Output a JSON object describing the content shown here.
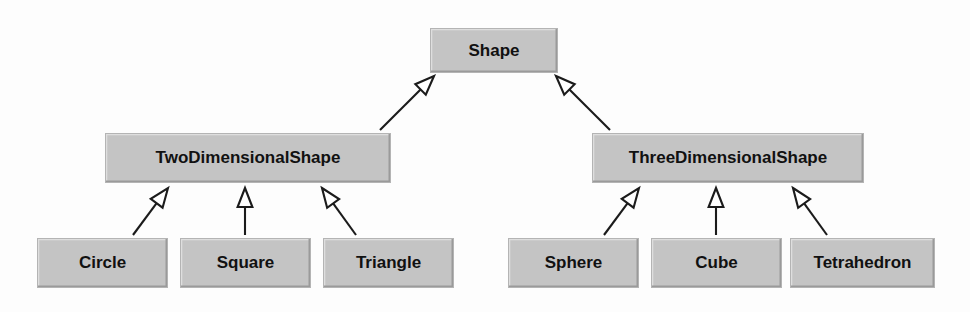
{
  "diagram": {
    "kind": "uml-class-hierarchy",
    "canvas": {
      "width": 970,
      "height": 312
    },
    "background_color": "#fdfdfd",
    "style": {
      "box_fill": "#c4c4c4",
      "box_highlight": "#dedede",
      "box_shadow": "#9a9a9a",
      "box_outline": "#b4b4b4",
      "line_color": "#1b1b1b",
      "arrow_fill": "#ffffff",
      "text_color": "#111111"
    },
    "relationship": "generalization",
    "arrowhead": "hollow-triangle",
    "nodes": [
      {
        "id": "shape",
        "label": "Shape",
        "level": 0,
        "x": 430,
        "y": 28,
        "w": 128,
        "h": 45,
        "font_size": 17
      },
      {
        "id": "two-dimensional-shape",
        "label": "TwoDimensionalShape",
        "level": 1,
        "x": 105,
        "y": 133,
        "w": 286,
        "h": 50,
        "font_size": 17
      },
      {
        "id": "three-dimensional-shape",
        "label": "ThreeDimensionalShape",
        "level": 1,
        "x": 592,
        "y": 133,
        "w": 272,
        "h": 50,
        "font_size": 17
      },
      {
        "id": "circle",
        "label": "Circle",
        "level": 2,
        "x": 37,
        "y": 238,
        "w": 131,
        "h": 50,
        "font_size": 17
      },
      {
        "id": "square",
        "label": "Square",
        "level": 2,
        "x": 180,
        "y": 238,
        "w": 131,
        "h": 50,
        "font_size": 17
      },
      {
        "id": "triangle",
        "label": "Triangle",
        "level": 2,
        "x": 323,
        "y": 238,
        "w": 131,
        "h": 50,
        "font_size": 17
      },
      {
        "id": "sphere",
        "label": "Sphere",
        "level": 2,
        "x": 508,
        "y": 238,
        "w": 131,
        "h": 50,
        "font_size": 17
      },
      {
        "id": "cube",
        "label": "Cube",
        "level": 2,
        "x": 651,
        "y": 238,
        "w": 131,
        "h": 50,
        "font_size": 17
      },
      {
        "id": "tetrahedron",
        "label": "Tetrahedron",
        "level": 2,
        "x": 790,
        "y": 238,
        "w": 145,
        "h": 50,
        "font_size": 17
      }
    ],
    "edges": [
      {
        "id": "edge-2d-to-shape",
        "from": "two-dimensional-shape",
        "to": "shape",
        "tail_x": 380,
        "tail_y": 130,
        "head_x": 434,
        "head_y": 76
      },
      {
        "id": "edge-3d-to-shape",
        "from": "three-dimensional-shape",
        "to": "shape",
        "tail_x": 610,
        "tail_y": 130,
        "head_x": 556,
        "head_y": 76
      },
      {
        "id": "edge-circle-to-2d",
        "from": "circle",
        "to": "two-dimensional-shape",
        "tail_x": 133,
        "tail_y": 235,
        "head_x": 168,
        "head_y": 188
      },
      {
        "id": "edge-square-to-2d",
        "from": "square",
        "to": "two-dimensional-shape",
        "tail_x": 245,
        "tail_y": 235,
        "head_x": 245,
        "head_y": 188
      },
      {
        "id": "edge-triangle-to-2d",
        "from": "triangle",
        "to": "two-dimensional-shape",
        "tail_x": 356,
        "tail_y": 235,
        "head_x": 322,
        "head_y": 188
      },
      {
        "id": "edge-sphere-to-3d",
        "from": "sphere",
        "to": "three-dimensional-shape",
        "tail_x": 604,
        "tail_y": 235,
        "head_x": 639,
        "head_y": 188
      },
      {
        "id": "edge-cube-to-3d",
        "from": "cube",
        "to": "three-dimensional-shape",
        "tail_x": 716,
        "tail_y": 235,
        "head_x": 716,
        "head_y": 188
      },
      {
        "id": "edge-tetra-to-3d",
        "from": "tetrahedron",
        "to": "three-dimensional-shape",
        "tail_x": 827,
        "tail_y": 235,
        "head_x": 793,
        "head_y": 188
      }
    ]
  }
}
